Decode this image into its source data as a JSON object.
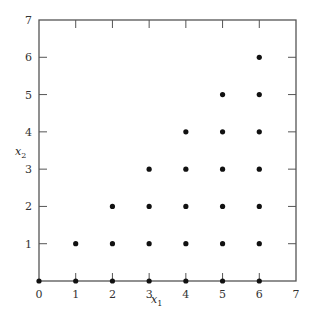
{
  "chart_data": {
    "type": "scatter",
    "title": "",
    "xlabel": "x1",
    "ylabel": "x2",
    "xlim": [
      0,
      7
    ],
    "ylim": [
      0,
      7
    ],
    "x_ticks": [
      0,
      1,
      2,
      3,
      4,
      5,
      6,
      7
    ],
    "y_ticks": [
      1,
      2,
      3,
      4,
      5,
      6,
      7
    ],
    "grid": false,
    "legend": null,
    "points": [
      [
        0,
        0
      ],
      [
        1,
        0
      ],
      [
        1,
        1
      ],
      [
        2,
        0
      ],
      [
        2,
        1
      ],
      [
        2,
        2
      ],
      [
        3,
        0
      ],
      [
        3,
        1
      ],
      [
        3,
        2
      ],
      [
        3,
        3
      ],
      [
        4,
        0
      ],
      [
        4,
        1
      ],
      [
        4,
        2
      ],
      [
        4,
        3
      ],
      [
        4,
        4
      ],
      [
        5,
        0
      ],
      [
        5,
        1
      ],
      [
        5,
        2
      ],
      [
        5,
        3
      ],
      [
        5,
        4
      ],
      [
        5,
        5
      ],
      [
        6,
        0
      ],
      [
        6,
        1
      ],
      [
        6,
        2
      ],
      [
        6,
        3
      ],
      [
        6,
        4
      ],
      [
        6,
        5
      ],
      [
        6,
        6
      ]
    ],
    "marker_color": "#111111"
  },
  "labels": {
    "x_main": "x",
    "x_sub": "1",
    "y_main": "x",
    "y_sub": "2",
    "origin": "0"
  }
}
